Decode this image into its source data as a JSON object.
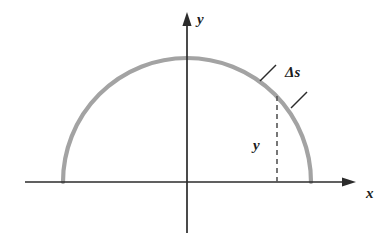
{
  "figure": {
    "type": "math-diagram",
    "background_color": "#ffffff",
    "axes": {
      "x_axis": {
        "label": "x",
        "color": "#2b2b2b",
        "start_x": 25,
        "end_x": 356,
        "y": 182,
        "arrow": "right",
        "label_x": 366,
        "label_y": 198
      },
      "y_axis": {
        "label": "y",
        "color": "#2b2b2b",
        "x": 187,
        "top_y": 12,
        "bottom_y": 233,
        "arrow": "up",
        "label_x": 197,
        "label_y": 24
      },
      "origin": {
        "x": 187,
        "y": 182
      }
    },
    "curve": {
      "name": "semicircle",
      "color": "#a3a3a3",
      "stroke_width": 4.2,
      "center_x": 187,
      "center_y": 182,
      "radius": 124,
      "left_end_x": 63,
      "right_end_x": 311,
      "apex_y": 58
    },
    "ordinate": {
      "name": "dashed-ordinate",
      "label": "y",
      "color": "#555555",
      "x": 277,
      "top_y": 96,
      "bottom_y": 182,
      "dash": "5,4",
      "label_x": 253,
      "label_y": 150
    },
    "arc_element": {
      "label": "Δs",
      "label_x": 285,
      "label_y": 77,
      "leader_color": "#2b2b2b",
      "upper_tick": {
        "x1": 260,
        "y1": 81,
        "x2": 276,
        "y2": 65
      },
      "lower_tick": {
        "x1": 291,
        "y1": 108,
        "x2": 307,
        "y2": 92
      }
    }
  }
}
